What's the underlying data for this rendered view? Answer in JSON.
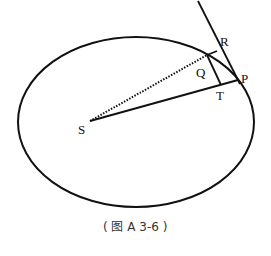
{
  "diagram": {
    "labels": {
      "S": "S",
      "P": "P",
      "Q": "Q",
      "R": "R",
      "T": "T"
    },
    "caption": "( 图 A 3-6 )",
    "elements": {
      "orbit": "ellipse",
      "tangent": "line through P and R",
      "radius_SP": "solid line S to P",
      "radius_SQ": "dotted line S to Q",
      "segment_QT": "solid line Q to T",
      "segment_QR": "solid line Q to R"
    },
    "colors": {
      "stroke": "#111111",
      "background": "#ffffff"
    }
  }
}
